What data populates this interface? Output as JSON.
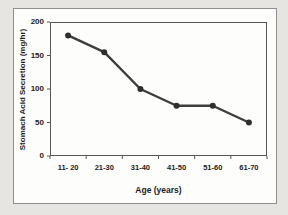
{
  "chart_data": {
    "type": "line",
    "title": "",
    "categories": [
      "11- 20",
      "21-30",
      "31-40",
      "41-50",
      "51-60",
      "61-70"
    ],
    "values": [
      180,
      155,
      100,
      75,
      75,
      50
    ],
    "xlabel": "Age (years)",
    "ylabel": "Stomach Acid Secretion (mg/hr)",
    "ylim": [
      0,
      200
    ],
    "yticks": [
      0,
      50,
      100,
      150,
      200
    ],
    "grid": false,
    "legend": "none",
    "marker": "round",
    "line_color": "#3d3d3d",
    "marker_color": "#2e2e2e",
    "axis_color": "#555555",
    "tick_color": "#555555",
    "text_color": "#1c1c1c",
    "plot_bg": "#fdfdfb",
    "frame_border_color": "#8f8f8f",
    "page_bg": "#e7e5e1"
  }
}
